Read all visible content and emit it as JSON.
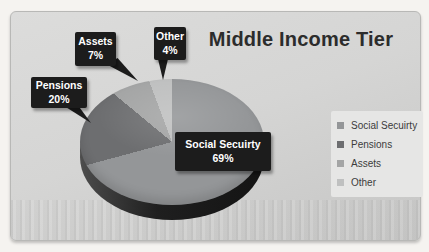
{
  "chart_data": {
    "type": "pie",
    "title": "Middle Income Tier",
    "slices": [
      {
        "label": "Social Secuirty",
        "value": 69,
        "pct": "69%",
        "color": "#949698"
      },
      {
        "label": "Pensions",
        "value": 20,
        "pct": "20%",
        "color": "#6d6e70"
      },
      {
        "label": "Assets",
        "value": 7,
        "pct": "7%",
        "color": "#a4a5a5"
      },
      {
        "label": "Other",
        "value": 4,
        "pct": "4%",
        "color": "#bfc0c0"
      }
    ],
    "unit": "%",
    "effect": "3d-pie",
    "start_angle_deg": 0,
    "direction": "clockwise",
    "legend_position": "right",
    "labels_shown_as": "dark-callout-boxes"
  },
  "colors": {
    "page_bg": "#f5f3f0",
    "chart_bg": "#d5d5d4",
    "callout_bg": "#1c1c1c",
    "callout_text": "#ffffff",
    "title_text": "#2c2c2c",
    "legend_bg": "#e6e6e5",
    "legend_text": "#3c3c3c",
    "pie_side_dark": "#1f1f1f"
  }
}
